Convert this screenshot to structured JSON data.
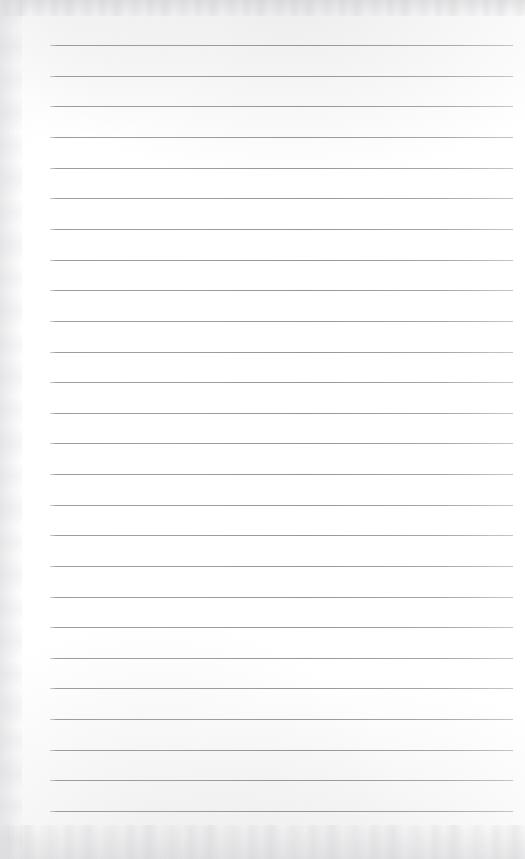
{
  "document": {
    "kind": "lined-paper-scan",
    "title": "Blank Ruled Notebook Page",
    "page_width": 525,
    "page_height": 859,
    "background_color": "#fefefe",
    "has_text_content": false,
    "has_header": false,
    "has_footer": false,
    "has_vertical_margin_rule": false,
    "page_number": ""
  },
  "ruling": {
    "line_color": "#a0a0a5",
    "line_thickness_px": 1,
    "line_count": 26,
    "first_line_y": 45,
    "line_spacing_px": 30.6,
    "line_start_x": 50,
    "line_end_x": 513,
    "left_margin_px": 50,
    "right_margin_px": 12,
    "lines": [
      {
        "index": 1,
        "y": 45
      },
      {
        "index": 2,
        "y": 76
      },
      {
        "index": 3,
        "y": 106
      },
      {
        "index": 4,
        "y": 137
      },
      {
        "index": 5,
        "y": 168
      },
      {
        "index": 6,
        "y": 198
      },
      {
        "index": 7,
        "y": 229
      },
      {
        "index": 8,
        "y": 260
      },
      {
        "index": 9,
        "y": 290
      },
      {
        "index": 10,
        "y": 321
      },
      {
        "index": 11,
        "y": 352
      },
      {
        "index": 12,
        "y": 382
      },
      {
        "index": 13,
        "y": 413
      },
      {
        "index": 14,
        "y": 443
      },
      {
        "index": 15,
        "y": 474
      },
      {
        "index": 16,
        "y": 505
      },
      {
        "index": 17,
        "y": 535
      },
      {
        "index": 18,
        "y": 566
      },
      {
        "index": 19,
        "y": 597
      },
      {
        "index": 20,
        "y": 627
      },
      {
        "index": 21,
        "y": 658
      },
      {
        "index": 22,
        "y": 688
      },
      {
        "index": 23,
        "y": 719
      },
      {
        "index": 24,
        "y": 750
      },
      {
        "index": 25,
        "y": 780
      },
      {
        "index": 26,
        "y": 811
      }
    ]
  },
  "scan_artifacts": {
    "top_band_color": "#c8c8cc",
    "bottom_band_color": "#c6c6ca",
    "left_edge_color": "#dbdbde"
  }
}
